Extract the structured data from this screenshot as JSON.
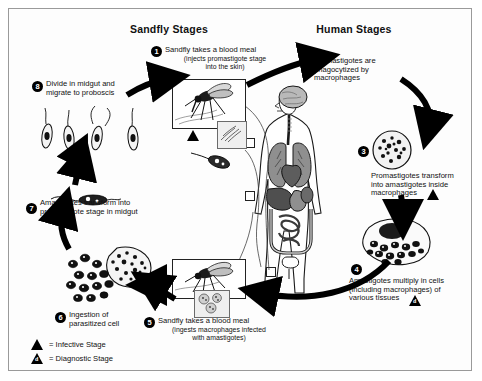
{
  "diagram": {
    "headers": {
      "left": "Sandfly Stages",
      "right": "Human Stages"
    },
    "steps": [
      {
        "number": "1",
        "text": "Sandfly takes a blood meal",
        "sub1": "(injects promastigote stage",
        "sub2": "into the skin)",
        "marker": "infective",
        "side": "sandfly"
      },
      {
        "number": "2",
        "text": "Promastigotes are",
        "sub1": "phagocytized by",
        "sub2": "macrophages",
        "marker": "none",
        "side": "human"
      },
      {
        "number": "3",
        "text": "Promastigotes transform",
        "sub1": "into amastigotes inside",
        "sub2": "macrophages",
        "marker": "infective",
        "side": "human"
      },
      {
        "number": "4",
        "text": "Amastigotes multiply in cells",
        "sub1": "(including macrophages) of",
        "sub2": "various tissues",
        "marker": "diagnostic",
        "side": "human"
      },
      {
        "number": "5",
        "text": "Sandfly takes a blood meal",
        "sub1": "(ingests macrophages infected",
        "sub2": "with amastigotes)",
        "marker": "none",
        "side": "sandfly"
      },
      {
        "number": "6",
        "text": "Ingestion of",
        "sub1": "parasitized cell",
        "sub2": "",
        "marker": "none",
        "side": "sandfly"
      },
      {
        "number": "7",
        "text": "Amastigotes transform into",
        "sub1": "promastigote stage in midgut",
        "sub2": "",
        "marker": "none",
        "side": "sandfly"
      },
      {
        "number": "8",
        "text": "Divide in midgut and",
        "sub1": "migrate to proboscis",
        "sub2": "",
        "marker": "none",
        "side": "sandfly"
      }
    ],
    "legend": [
      {
        "symbol": "infective",
        "label": "= Infective Stage"
      },
      {
        "symbol": "diagnostic",
        "label": "= Diagnostic Stage"
      }
    ],
    "colors": {
      "ink": "#111111",
      "border": "#9a9a9a",
      "background": "#fdfdfd",
      "organ_light": "#b9b9b9",
      "organ_mid": "#8f8f8f",
      "organ_dark": "#5d5d5d"
    }
  }
}
